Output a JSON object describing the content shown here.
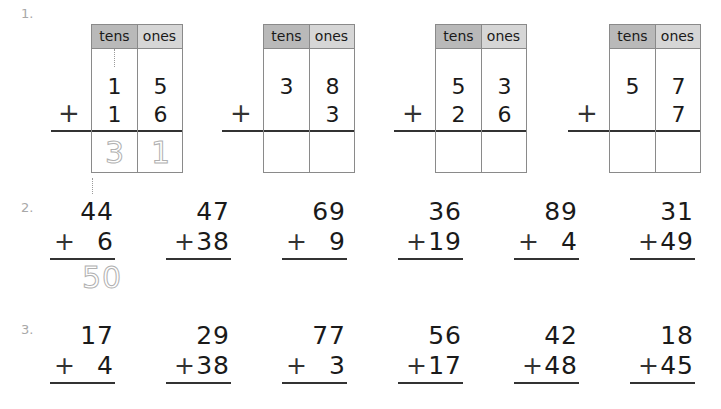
{
  "sections": [
    {
      "label": "1."
    },
    {
      "label": "2."
    },
    {
      "label": "3."
    }
  ],
  "place_value_headers": {
    "tens": "tens",
    "ones": "ones"
  },
  "plus_sign": "+",
  "section1": {
    "problems": [
      {
        "top_tens": "1",
        "top_ones": "5",
        "bot_tens": "1",
        "bot_ones": "6",
        "answer_tens": "3",
        "answer_ones": "1",
        "carry": true,
        "example": true
      },
      {
        "top_tens": "3",
        "top_ones": "8",
        "bot_tens": "",
        "bot_ones": "3",
        "answer_tens": "",
        "answer_ones": ""
      },
      {
        "top_tens": "5",
        "top_ones": "3",
        "bot_tens": "2",
        "bot_ones": "6",
        "answer_tens": "",
        "answer_ones": ""
      },
      {
        "top_tens": "5",
        "top_ones": "7",
        "bot_tens": "",
        "bot_ones": "7",
        "answer_tens": "",
        "answer_ones": ""
      }
    ]
  },
  "section2": {
    "problems": [
      {
        "top": "44",
        "bottom": "6",
        "answer": "50",
        "carry": true,
        "example": true
      },
      {
        "top": "47",
        "bottom": "38"
      },
      {
        "top": "69",
        "bottom": "9"
      },
      {
        "top": "36",
        "bottom": "19"
      },
      {
        "top": "89",
        "bottom": "4"
      },
      {
        "top": "31",
        "bottom": "49"
      }
    ]
  },
  "section3": {
    "problems": [
      {
        "top": "17",
        "bottom": "4"
      },
      {
        "top": "29",
        "bottom": "38"
      },
      {
        "top": "77",
        "bottom": "3"
      },
      {
        "top": "56",
        "bottom": "17"
      },
      {
        "top": "42",
        "bottom": "48"
      },
      {
        "top": "18",
        "bottom": "45"
      }
    ]
  },
  "colors": {
    "tens_header": "#b9b9b9",
    "ones_header": "#d6d6d6",
    "traced_example": "#b0b0b0",
    "section_label": "#a8a8a8"
  }
}
